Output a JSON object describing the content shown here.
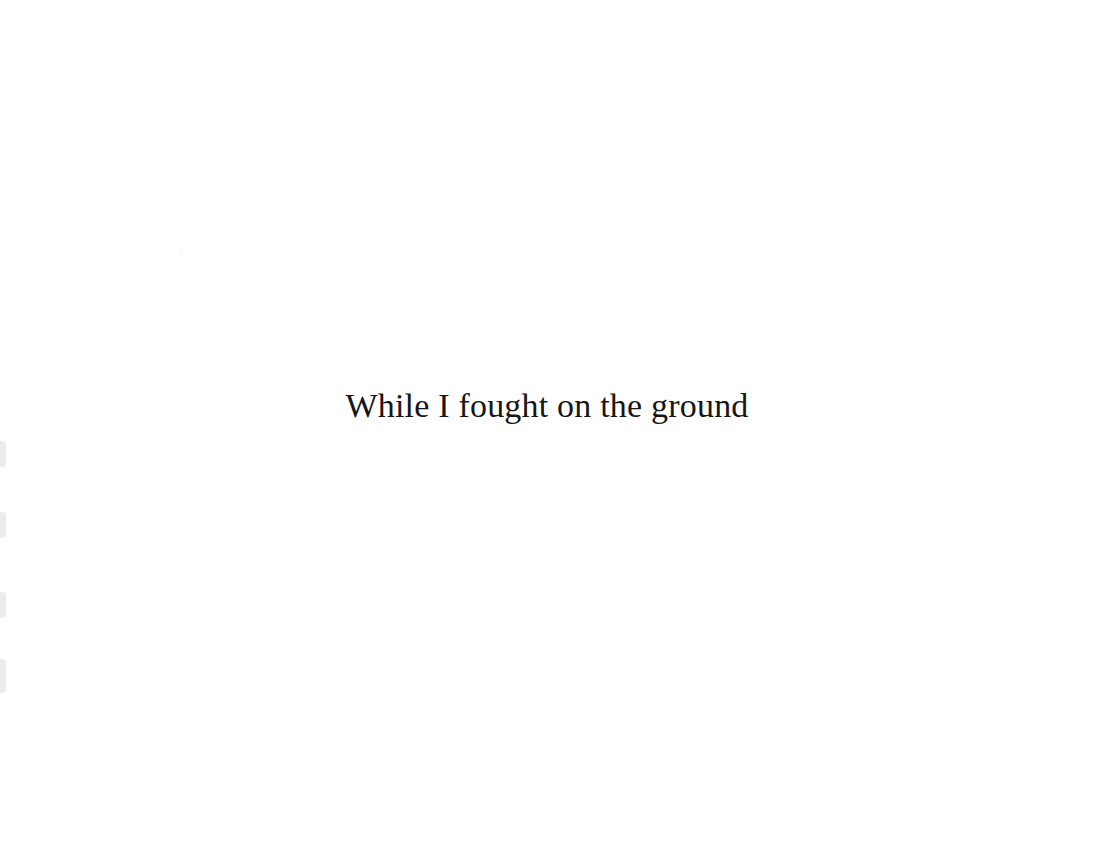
{
  "slide": {
    "background_color": "#ffffff",
    "caption": {
      "text": "While I fought on the ground",
      "color": "#161616",
      "font_size_px": 34,
      "align": "center"
    }
  },
  "edge_strip": {
    "name": "clipped-left-control-strip",
    "color": "#e9e9ec",
    "chips": [
      {
        "label": "",
        "top": 441,
        "height": 26
      },
      {
        "label": "",
        "top": 512,
        "height": 26
      },
      {
        "label": "",
        "top": 592,
        "height": 26
      },
      {
        "label": "",
        "top": 659,
        "height": 34
      }
    ]
  },
  "speck": {
    "name": "faint-artifact",
    "color": "#fbfbfc",
    "left": 178,
    "top": 247,
    "width": 6,
    "height": 9
  }
}
